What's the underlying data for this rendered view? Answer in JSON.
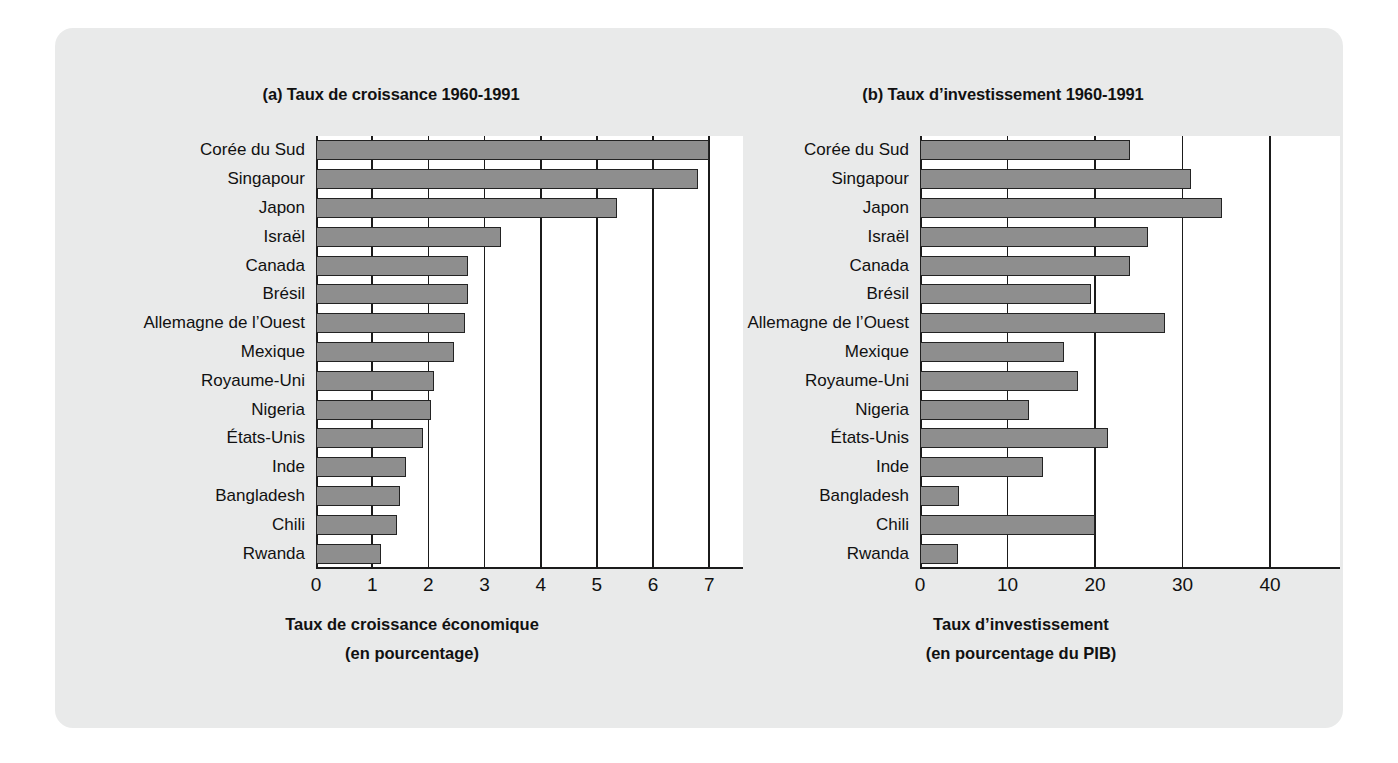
{
  "figure": {
    "background_color": "#e9eaea",
    "bar_fill_color": "#8e8e8e",
    "bar_edge_color": "#232323"
  },
  "chart_data": [
    {
      "type": "bar",
      "orientation": "horizontal",
      "panel": "a",
      "title": "(a) Taux de croissance 1960-1991",
      "xlabel_line1": "Taux de croissance économique",
      "xlabel_line2": "(en pourcentage)",
      "ylabel": "",
      "xlim": [
        0,
        7.6
      ],
      "xticks": [
        0,
        1,
        2,
        3,
        4,
        5,
        6,
        7
      ],
      "xticklabels": [
        "0",
        "1",
        "2",
        "3",
        "4",
        "5",
        "6",
        "7"
      ],
      "grid": true,
      "legend": "none",
      "categories": [
        "Corée du Sud",
        "Singapour",
        "Japon",
        "Israël",
        "Canada",
        "Brésil",
        "Allemagne de l’Ouest",
        "Mexique",
        "Royaume-Uni",
        "Nigeria",
        "États-Unis",
        "Inde",
        "Bangladesh",
        "Chili",
        "Rwanda"
      ],
      "values": [
        7.0,
        6.8,
        5.35,
        3.3,
        2.7,
        2.7,
        2.65,
        2.45,
        2.1,
        2.05,
        1.9,
        1.6,
        1.5,
        1.45,
        1.15
      ]
    },
    {
      "type": "bar",
      "orientation": "horizontal",
      "panel": "b",
      "title": "(b) Taux d’investissement 1960-1991",
      "xlabel_line1": "Taux d’investissement",
      "xlabel_line2": "(en pourcentage du PIB)",
      "ylabel": "",
      "xlim": [
        0,
        48
      ],
      "xticks": [
        0,
        10,
        20,
        30,
        40
      ],
      "xticklabels": [
        "0",
        "10",
        "20",
        "30",
        "40"
      ],
      "grid": true,
      "legend": "none",
      "categories": [
        "Corée du Sud",
        "Singapour",
        "Japon",
        "Israël",
        "Canada",
        "Brésil",
        "Allemagne de l’Ouest",
        "Mexique",
        "Royaume-Uni",
        "Nigeria",
        "États-Unis",
        "Inde",
        "Bangladesh",
        "Chili",
        "Rwanda"
      ],
      "values": [
        24.0,
        31.0,
        34.5,
        26.0,
        24.0,
        19.5,
        28.0,
        16.5,
        18.0,
        12.5,
        21.5,
        14.0,
        4.5,
        20.0,
        4.3
      ]
    }
  ]
}
